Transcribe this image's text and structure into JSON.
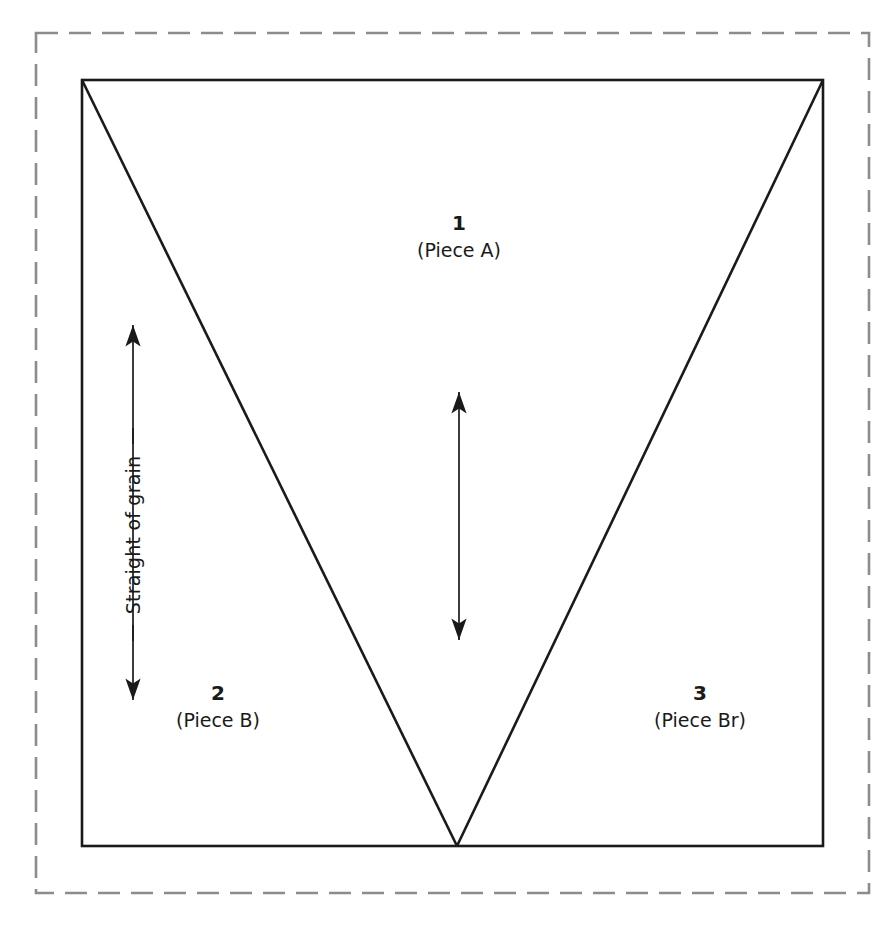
{
  "diagram": {
    "type": "cutting-layout",
    "colors": {
      "line": "#1a1a1a",
      "fabric_fold_dashed": "#8c8c8c",
      "background": "#ffffff",
      "text": "#1a1a1a"
    },
    "fabric_edge": {
      "name": "dashed fabric boundary",
      "style": "dashed",
      "dash_length_px": 22,
      "dash_gap_px": 11,
      "rect": {
        "x": 36,
        "y": 33,
        "width": 833,
        "height": 860
      }
    },
    "fabric_piece": {
      "name": "solid fabric rectangle",
      "style": "solid",
      "rect": {
        "x": 82,
        "y": 80,
        "width": 741,
        "height": 766
      }
    },
    "cut_lines": [
      {
        "name": "left-diagonal",
        "from": [
          82,
          80
        ],
        "to": [
          457,
          846
        ]
      },
      {
        "name": "right-diagonal",
        "from": [
          823,
          80
        ],
        "to": [
          457,
          846
        ]
      }
    ],
    "grain_arrow": {
      "name": "straight-of-grain-arrow",
      "label": "Straight of grain",
      "double_headed": true,
      "x": 133,
      "y_top": 325,
      "y_bottom": 700,
      "leader_top_y": 437,
      "leader_bottom_y": 633
    },
    "center_arrow": {
      "name": "center-grain-arrow",
      "double_headed": true,
      "x": 459,
      "y_top": 392,
      "y_bottom": 640
    },
    "labels": [
      {
        "id": "piece-a",
        "number": "1",
        "name": "(Piece A)",
        "center": [
          459,
          232
        ]
      },
      {
        "id": "piece-b",
        "number": "2",
        "name": "(Piece B)",
        "center": [
          218,
          702
        ]
      },
      {
        "id": "piece-br",
        "number": "3",
        "name": "(Piece Br)",
        "center": [
          700,
          702
        ]
      }
    ]
  }
}
